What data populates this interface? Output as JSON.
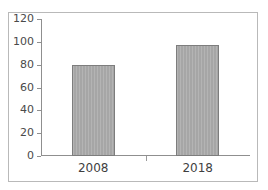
{
  "chart_data": {
    "type": "bar",
    "title": "",
    "subtitle": "",
    "xlabel": "",
    "ylabel": "",
    "categories": [
      "2008",
      "2018"
    ],
    "values": [
      80,
      97
    ],
    "series": [
      {
        "name": "",
        "values": [
          80,
          97
        ]
      }
    ],
    "ylim": [
      0,
      120
    ],
    "y_ticks": [
      0,
      20,
      40,
      60,
      80,
      100,
      120
    ],
    "y_tick_labels": [
      "0",
      "20",
      "40",
      "60",
      "80",
      "100",
      "120"
    ],
    "grid": false,
    "legend": false,
    "legend_position": "none",
    "annotations": [],
    "colors": {
      "bar_fill": "#a9a9a9",
      "bar_border": "#7d7d7d",
      "axis": "#8f8f8f",
      "frame": "#b9b9b9",
      "tick_text": "#4a4a4a",
      "category_text": "#3f3f3f",
      "background": "#ffffff"
    }
  }
}
